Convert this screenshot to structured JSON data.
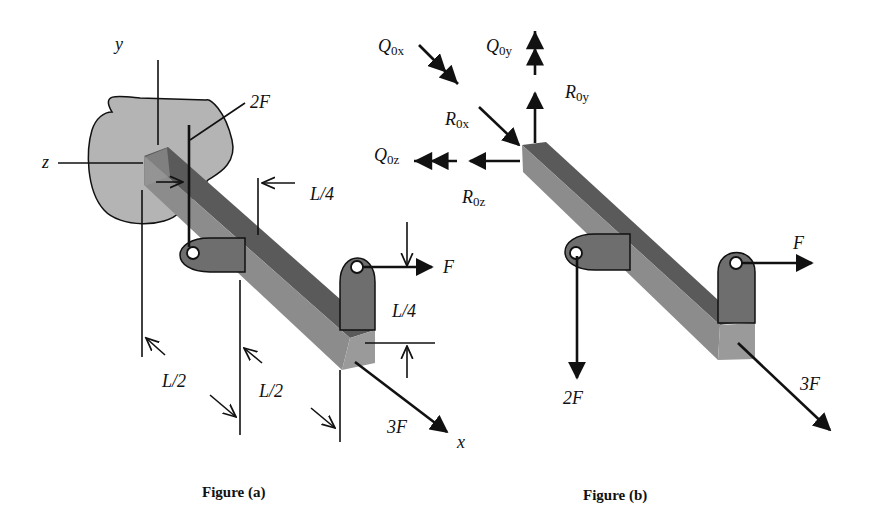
{
  "figure_a": {
    "caption": "Figure (a)",
    "axes": {
      "x": "x",
      "y": "y",
      "z": "z"
    },
    "loads": {
      "vertical": "2F",
      "horizontal": "F",
      "axial": "3F"
    },
    "dimensions": {
      "d1": "L/4",
      "d2": "L/4",
      "d3": "L/2",
      "d4": "L/2"
    }
  },
  "figure_b": {
    "caption": "Figure (b)",
    "reactions": {
      "Q0x": {
        "main": "Q",
        "sub": "0x"
      },
      "Q0y": {
        "main": "Q",
        "sub": "0y"
      },
      "Q0z": {
        "main": "Q",
        "sub": "0z"
      },
      "R0x": {
        "main": "R",
        "sub": "0x"
      },
      "R0y": {
        "main": "R",
        "sub": "0y"
      },
      "R0z": {
        "main": "R",
        "sub": "0z"
      }
    },
    "loads": {
      "horizontal": "F",
      "vertical": "2F",
      "axial": "3F"
    }
  },
  "colors": {
    "wall": "#b4b4b4",
    "beam_top": "#5a5a5a",
    "beam_side": "#8c8c8c",
    "beam_end": "#9a9a9a",
    "bracket": "#6e6e6e",
    "ink": "#111111"
  }
}
